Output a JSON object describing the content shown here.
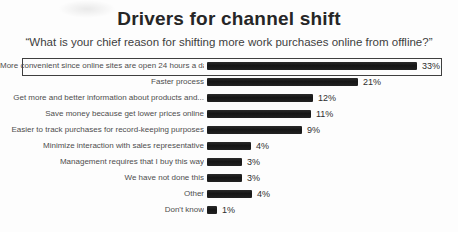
{
  "header": {
    "title": "Drivers for channel shift",
    "subtitle": "“What is your chief reason for shifting more work purchases online from offline?”"
  },
  "chart_data": {
    "type": "bar",
    "orientation": "horizontal",
    "title": "Drivers for channel shift",
    "subtitle": "“What is your chief reason for shifting more work purchases online from offline?”",
    "unit": "%",
    "categories": [
      "More convenient since online sites are open 24 hours a day",
      "Faster process",
      "Get more and better information about products and...",
      "Save money because get lower prices online",
      "Easier to track purchases for record-keeping purposes",
      "Minimize interaction with sales representative",
      "Management requires that I buy this way",
      "We have not done this",
      "Other",
      "Don't know"
    ],
    "values": [
      33,
      21,
      12,
      11,
      9,
      4,
      3,
      3,
      4,
      1
    ],
    "value_labels": [
      "33%",
      "21%",
      "12%",
      "11%",
      "9%",
      "4%",
      "3%",
      "3%",
      "4%",
      "1%"
    ],
    "highlighted_index": 0,
    "bar_color": "#1f1f1f",
    "highlight_border_color": "#3f3f3f",
    "axis": {
      "gridlines": false,
      "x_axis_shown": false,
      "value_labels_at_bar_end": true
    },
    "legend": "none",
    "layout": {
      "bar_px": [
        210,
        151,
        106,
        104,
        95,
        44,
        35,
        35,
        45,
        10
      ],
      "label_col_px": 204,
      "row_pitch_px": 16,
      "bar_height_px": 8
    }
  }
}
